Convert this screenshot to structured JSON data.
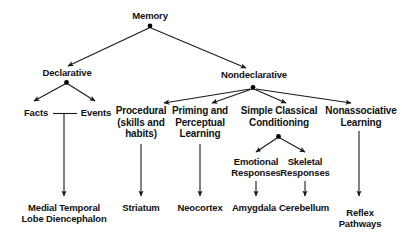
{
  "diagram": {
    "type": "hierarchy-tree",
    "colors": {
      "background": "#ffffff",
      "text": "#111111",
      "edge": "#1a1a1a",
      "node_dot": "#000000"
    },
    "nodes": {
      "memory": {
        "label": "Memory",
        "lines": [
          "Memory"
        ]
      },
      "declarative": {
        "label": "Declarative",
        "lines": [
          "Declarative"
        ]
      },
      "nondeclarative": {
        "label": "Nondeclarative",
        "lines": [
          "Nondeclarative"
        ]
      },
      "facts": {
        "label": "Facts",
        "lines": [
          "Facts"
        ]
      },
      "events": {
        "label": "Events",
        "lines": [
          "Events"
        ]
      },
      "procedural": {
        "label": "Procedural (skills and habits)",
        "lines": [
          "Procedural",
          "(skills and",
          "habits)"
        ]
      },
      "priming": {
        "label": "Priming and Perceptual Learning",
        "lines": [
          "Priming and",
          "Perceptual",
          "Learning"
        ]
      },
      "conditioning": {
        "label": "Simple Classical Conditioning",
        "lines": [
          "Simple Classical",
          "Conditioning"
        ]
      },
      "nonassociative": {
        "label": "Nonassociative Learning",
        "lines": [
          "Nonassociative",
          "Learning"
        ]
      },
      "emotional": {
        "label": "Emotional Responses",
        "lines": [
          "Emotional",
          "Responses"
        ]
      },
      "skeletal": {
        "label": "Skeletal Responses",
        "lines": [
          "Skeletal",
          "Responses"
        ]
      },
      "medial": {
        "label": "Medial Temporal Lobe Diencephalon",
        "lines": [
          "Medial Temporal",
          "Lobe Diencephalon"
        ]
      },
      "striatum": {
        "label": "Striatum",
        "lines": [
          "Striatum"
        ]
      },
      "neocortex": {
        "label": "Neocortex",
        "lines": [
          "Neocortex"
        ]
      },
      "amygdala": {
        "label": "Amygdala",
        "lines": [
          "Amygdala"
        ]
      },
      "cerebellum": {
        "label": "Cerebellum",
        "lines": [
          "Cerebellum"
        ]
      },
      "reflex": {
        "label": "Reflex Pathways",
        "lines": [
          "Reflex",
          "Pathways"
        ]
      }
    },
    "edges": [
      {
        "from": "memory",
        "to": "declarative"
      },
      {
        "from": "memory",
        "to": "nondeclarative"
      },
      {
        "from": "declarative",
        "to": "facts"
      },
      {
        "from": "declarative",
        "to": "events"
      },
      {
        "from": "facts",
        "to": "medial",
        "style": "bracket-joined"
      },
      {
        "from": "events",
        "to": "medial",
        "style": "bracket-joined"
      },
      {
        "from": "nondeclarative",
        "to": "procedural"
      },
      {
        "from": "nondeclarative",
        "to": "priming"
      },
      {
        "from": "nondeclarative",
        "to": "conditioning"
      },
      {
        "from": "nondeclarative",
        "to": "nonassociative"
      },
      {
        "from": "conditioning",
        "to": "emotional"
      },
      {
        "from": "conditioning",
        "to": "skeletal"
      },
      {
        "from": "procedural",
        "to": "striatum"
      },
      {
        "from": "priming",
        "to": "neocortex"
      },
      {
        "from": "emotional",
        "to": "amygdala"
      },
      {
        "from": "skeletal",
        "to": "cerebellum"
      },
      {
        "from": "nonassociative",
        "to": "reflex"
      }
    ]
  }
}
